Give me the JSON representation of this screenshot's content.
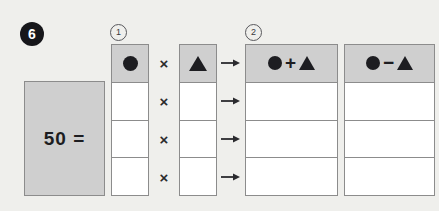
{
  "problem": {
    "number": "6",
    "total_expression": "50 ="
  },
  "steps": [
    {
      "marker": "1"
    },
    {
      "marker": "2"
    }
  ],
  "operators": {
    "multiply_sign": "×",
    "arrow": "arrow-right-icon",
    "plus_sign": "+",
    "minus_sign": "−"
  },
  "symbols": {
    "circle": "circle-icon",
    "triangle": "triangle-icon"
  },
  "columns": [
    {
      "name": "factor-a",
      "header_kind": "circle",
      "header_text": "●",
      "rows": [
        "",
        "",
        ""
      ]
    },
    {
      "name": "factor-b",
      "header_kind": "triangle",
      "header_text": "▲",
      "rows": [
        "",
        "",
        ""
      ]
    },
    {
      "name": "sum",
      "header_kind": "circle-plus-triangle",
      "header_text": "●+▲",
      "rows": [
        "",
        "",
        ""
      ]
    },
    {
      "name": "difference",
      "header_kind": "circle-minus-triangle",
      "header_text": "●−▲",
      "rows": [
        "",
        "",
        ""
      ]
    }
  ],
  "row_count": 4,
  "colors": {
    "background": "#efefec",
    "panel_fill": "#cfcfcf",
    "cell_fill": "#ffffff",
    "border": "#8c8c8c",
    "ink": "#1d1d21",
    "badge_fill": "#16161a"
  }
}
